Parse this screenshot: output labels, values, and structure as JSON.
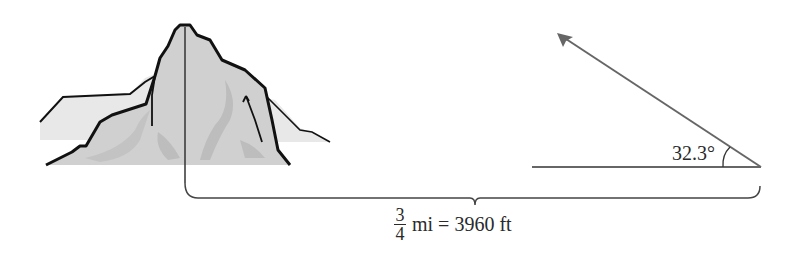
{
  "diagram": {
    "type": "trigonometry-angle-of-elevation",
    "angle_label": "32.3°",
    "distance": {
      "fraction_numerator": "3",
      "fraction_denominator": "4",
      "rest": "mi = 3960 ft"
    },
    "colors": {
      "line": "#555555",
      "outline": "#111111",
      "mountain_fill": "#cfcfcf",
      "mountain_shadow": "#b5b5b5",
      "background_hills": "#e6e6e6"
    }
  }
}
